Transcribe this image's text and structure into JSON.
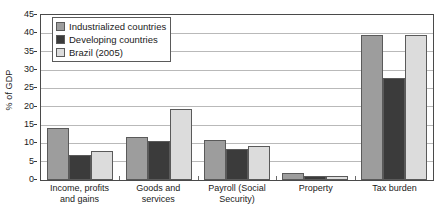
{
  "chart_data": {
    "type": "bar",
    "title": "",
    "xlabel": "",
    "ylabel": "% of GDP",
    "ylim": [
      0,
      45
    ],
    "ytick_step": 5,
    "yticks": [
      "0",
      "5",
      "10",
      "15",
      "20",
      "25",
      "30",
      "35",
      "40",
      "45"
    ],
    "grid": true,
    "legend_position": "top-left-inside",
    "categories": [
      "Income, profits and gains",
      "Goods and services",
      "Payroll (Social Security)",
      "Property",
      "Tax burden"
    ],
    "series": [
      {
        "name": "Industrialized countries",
        "color": "#9d9d9d",
        "values": [
          14.3,
          11.7,
          11.0,
          2.0,
          39.6
        ]
      },
      {
        "name": "Developing countries",
        "color": "#3b3b3b",
        "values": [
          6.8,
          10.7,
          8.4,
          1.1,
          27.7
        ]
      },
      {
        "name": "Brazil (2005)",
        "color": "#dcdcdc",
        "values": [
          7.8,
          19.5,
          9.2,
          1.0,
          39.5
        ]
      }
    ]
  }
}
